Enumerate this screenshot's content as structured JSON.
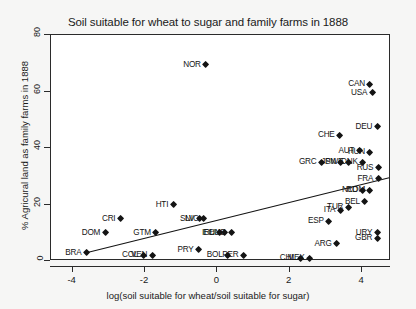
{
  "chart_data": {
    "type": "scatter",
    "title": "Soil suitable for wheat to sugar and family farms in 1888",
    "xlabel": "log(soil suitable for wheat/soil suitable for sugar)",
    "ylabel": "% Agricural land as family farms in 1888",
    "xlim": [
      -4.6,
      4.8
    ],
    "ylim": [
      0,
      80
    ],
    "xticks": [
      -4,
      -2,
      0,
      2,
      4
    ],
    "xticklabels": [
      "-4",
      "-2",
      "0",
      "2",
      "4"
    ],
    "yticks": [
      0,
      20,
      40,
      60,
      80
    ],
    "yticklabels": [
      "0",
      "20",
      "40",
      "60",
      "80"
    ],
    "grid": false,
    "legend": "none",
    "marker": "filled-diamond",
    "marker_color": "#141414",
    "fit_line": {
      "type": "linear",
      "x0": -3.65,
      "y0": 2.8,
      "x1": 4.75,
      "y1": 29.5,
      "color": "#141414"
    },
    "points": [
      {
        "label": "BRA",
        "x": -3.62,
        "y": 3.0,
        "label_side": "left"
      },
      {
        "label": "DOM",
        "x": -3.1,
        "y": 10.0,
        "label_side": "left"
      },
      {
        "label": "CRI",
        "x": -2.68,
        "y": 15.0,
        "label_side": "left"
      },
      {
        "label": "COL",
        "x": -2.05,
        "y": 2.0,
        "label_side": "left"
      },
      {
        "label": "VEN",
        "x": -1.8,
        "y": 2.0,
        "label_side": "left"
      },
      {
        "label": "GTM",
        "x": -1.7,
        "y": 10.0,
        "label_side": "left"
      },
      {
        "label": "HTI",
        "x": -1.22,
        "y": 20.0,
        "label_side": "left"
      },
      {
        "label": "SLV",
        "x": -0.5,
        "y": 15.0,
        "label_side": "left"
      },
      {
        "label": "NIC",
        "x": -0.38,
        "y": 15.0,
        "label_side": "left"
      },
      {
        "label": "PRY",
        "x": -0.52,
        "y": 4.0,
        "label_side": "left"
      },
      {
        "label": "IRL",
        "x": 0.05,
        "y": 10.0,
        "label_side": "left"
      },
      {
        "label": "ECU",
        "x": 0.2,
        "y": 10.0,
        "label_side": "left"
      },
      {
        "label": "HND",
        "x": 0.38,
        "y": 10.0,
        "label_side": "left"
      },
      {
        "label": "BOL",
        "x": 0.28,
        "y": 2.0,
        "label_side": "left"
      },
      {
        "label": "PER",
        "x": 0.72,
        "y": 2.0,
        "label_side": "left"
      },
      {
        "label": "NOR",
        "x": -0.32,
        "y": 69.5,
        "label_side": "left"
      },
      {
        "label": "CHL",
        "x": 2.3,
        "y": 1.0,
        "label_side": "left"
      },
      {
        "label": "MEX",
        "x": 2.55,
        "y": 1.0,
        "label_side": "left"
      },
      {
        "label": "GRC",
        "x": 2.88,
        "y": 35.0,
        "label_side": "left"
      },
      {
        "label": "ESP",
        "x": 3.08,
        "y": 14.0,
        "label_side": "left"
      },
      {
        "label": "ARG",
        "x": 3.3,
        "y": 6.0,
        "label_side": "left"
      },
      {
        "label": "JPN",
        "x": 3.42,
        "y": 35.0,
        "label_side": "left"
      },
      {
        "label": "SWE",
        "x": 3.62,
        "y": 35.0,
        "label_side": "left"
      },
      {
        "label": "ITA",
        "x": 3.4,
        "y": 18.0,
        "label_side": "left"
      },
      {
        "label": "CHE",
        "x": 3.38,
        "y": 44.5,
        "label_side": "left"
      },
      {
        "label": "TUR",
        "x": 3.62,
        "y": 19.0,
        "label_side": "left"
      },
      {
        "label": "AUT",
        "x": 3.92,
        "y": 39.0,
        "label_side": "left"
      },
      {
        "label": "HUN",
        "x": 4.22,
        "y": 38.5,
        "label_side": "left"
      },
      {
        "label": "DNK",
        "x": 4.02,
        "y": 35.0,
        "label_side": "left"
      },
      {
        "label": "NLD",
        "x": 4.02,
        "y": 25.0,
        "label_side": "left"
      },
      {
        "label": "ROM",
        "x": 4.22,
        "y": 25.0,
        "label_side": "left"
      },
      {
        "label": "BEL",
        "x": 4.08,
        "y": 21.0,
        "label_side": "left"
      },
      {
        "label": "FRA",
        "x": 4.45,
        "y": 29.0,
        "label_side": "left"
      },
      {
        "label": "RUS",
        "x": 4.45,
        "y": 33.0,
        "label_side": "left"
      },
      {
        "label": "CAN",
        "x": 4.22,
        "y": 62.5,
        "label_side": "left"
      },
      {
        "label": "USA",
        "x": 4.28,
        "y": 59.5,
        "label_side": "left"
      },
      {
        "label": "DEU",
        "x": 4.42,
        "y": 47.5,
        "label_side": "left"
      },
      {
        "label": "URY",
        "x": 4.42,
        "y": 10.0,
        "label_side": "left"
      },
      {
        "label": "GBR",
        "x": 4.42,
        "y": 8.0,
        "label_side": "left"
      }
    ]
  }
}
